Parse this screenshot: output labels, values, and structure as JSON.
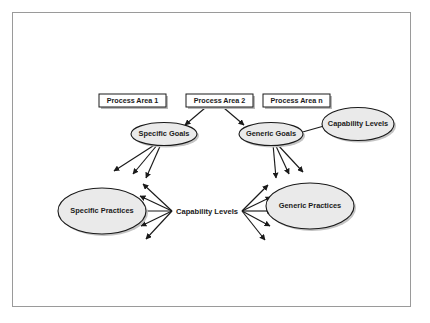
{
  "diagram": {
    "colors": {
      "frame_border": "#9a9a9a",
      "node_fill_box": "#ffffff",
      "node_fill_ellipse": "#eaeaea",
      "node_stroke": "#1a1a1a",
      "shadow": "#b9b9b9",
      "background": "#ffffff"
    },
    "process_areas": [
      {
        "id": "pa1",
        "label": "Process Area 1"
      },
      {
        "id": "pa2",
        "label": "Process Area 2"
      },
      {
        "id": "pan",
        "label": "Process Area n"
      }
    ],
    "goals": [
      {
        "id": "specific-goals",
        "label": "Specific Goals"
      },
      {
        "id": "generic-goals",
        "label": "Generic Goals"
      }
    ],
    "capability_levels_node": {
      "id": "capability-levels-ellipse",
      "label": "Capability Levels"
    },
    "practices": [
      {
        "id": "specific-practices",
        "label": "Specific Practices"
      },
      {
        "id": "generic-practices",
        "label": "Generic Practices"
      }
    ],
    "capability_levels_center": {
      "id": "capability-levels-center",
      "label": "Capability Levels"
    },
    "edges": [
      {
        "from": "pa2",
        "to": "specific-goals"
      },
      {
        "from": "pa2",
        "to": "generic-goals"
      },
      {
        "from": "capability-levels-ellipse",
        "to": "generic-goals"
      },
      {
        "from": "specific-goals",
        "to": "specific-practices"
      },
      {
        "from": "generic-goals",
        "to": "generic-practices"
      },
      {
        "from": "capability-levels-center",
        "to": "specific-practices"
      },
      {
        "from": "capability-levels-center",
        "to": "generic-practices"
      }
    ]
  }
}
